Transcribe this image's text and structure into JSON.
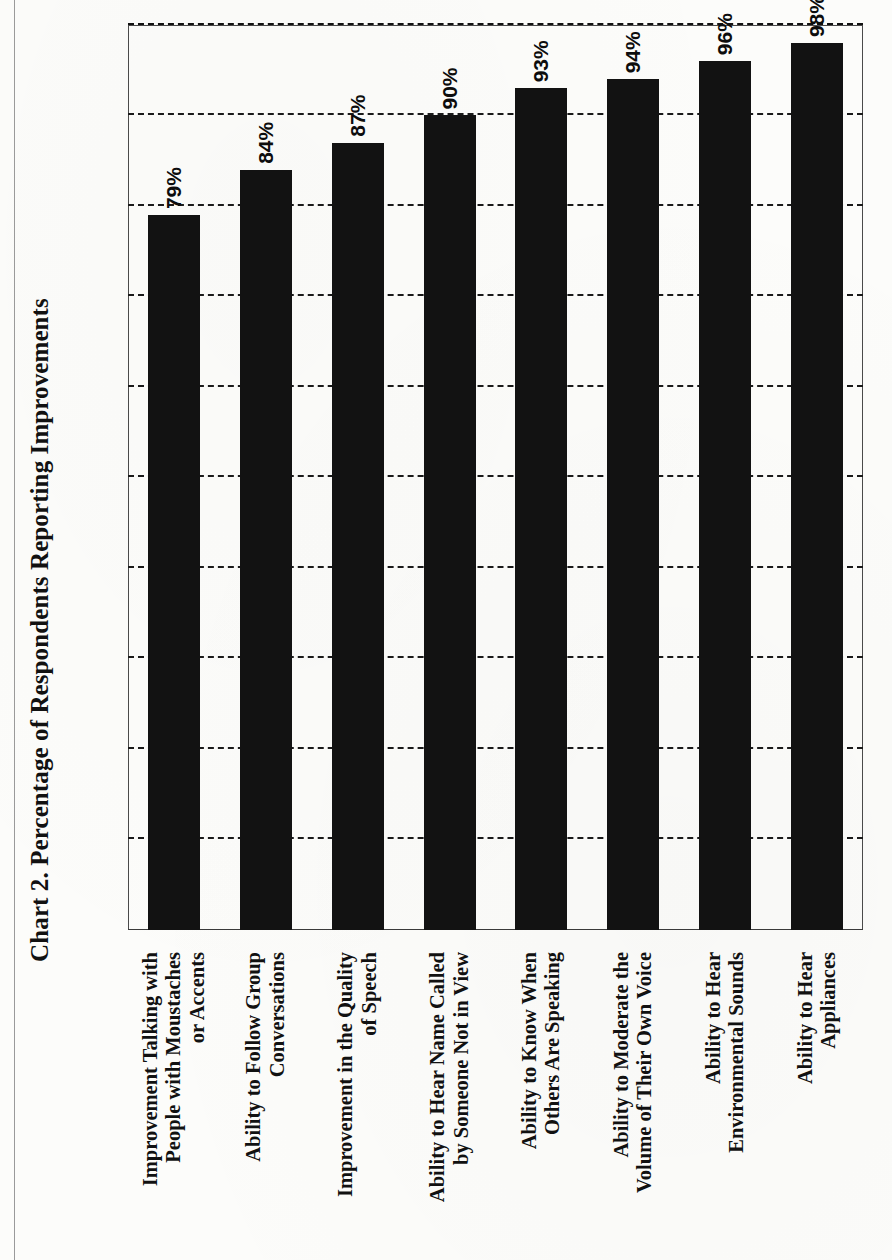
{
  "figure": {
    "title": "Chart 2. Percentage of Respondents Reporting Improvements",
    "orientation": "rotated-90-ccw",
    "bar_color": "#121212",
    "text_color": "#111111",
    "axis_color": "#3a3a3a"
  },
  "chart_data": {
    "type": "bar",
    "title": "Chart 2. Percentage of Respondents Reporting Improvements",
    "xlabel": "",
    "ylabel": "",
    "orientation": "horizontal",
    "grid": true,
    "legend": "none",
    "ylim": [
      0,
      100
    ],
    "tick_interval": 10,
    "categories": [
      "Improvement Talking with People with Moustaches or Accents",
      "Ability to Follow Group Conversations",
      "Improvement in the Quality of Speech",
      "Ability to Hear Name Called by Someone Not in View",
      "Ability to Know When Others Are Speaking",
      "Ability to Moderate the Volume of Their Own Voice",
      "Ability to Hear Environmental Sounds",
      "Ability to Hear Appliances"
    ],
    "values": [
      79,
      84,
      87,
      90,
      93,
      94,
      96,
      98
    ],
    "value_labels": [
      "79%",
      "84%",
      "87%",
      "90%",
      "93%",
      "94%",
      "96%",
      "98%"
    ]
  },
  "categories_wrapped": [
    [
      "Improvement Talking with",
      "People with Moustaches",
      "or Accents"
    ],
    [
      "Ability to Follow Group",
      "Conversations"
    ],
    [
      "Improvement in the Quality",
      "of Speech"
    ],
    [
      "Ability to Hear Name Called",
      "by Someone Not in View"
    ],
    [
      "Ability to Know When",
      "Others Are Speaking"
    ],
    [
      "Ability to Moderate the",
      "Volume of Their Own Voice"
    ],
    [
      "Ability to Hear",
      "Environmental Sounds"
    ],
    [
      "Ability to Hear",
      "Appliances"
    ]
  ]
}
